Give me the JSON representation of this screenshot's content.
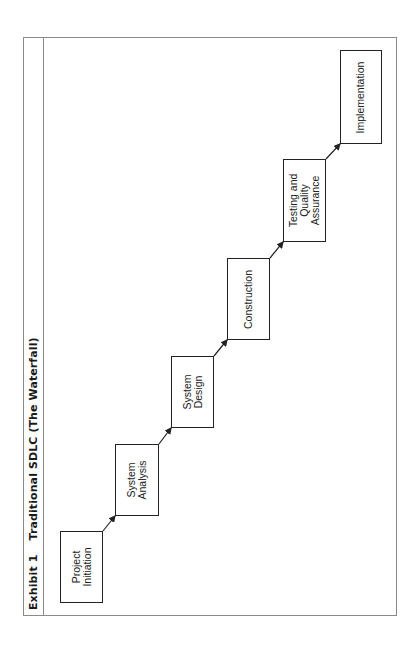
{
  "exhibit": {
    "number_label": "Exhibit 1",
    "title": "Traditional SDLC (The Waterfall)"
  },
  "stages": [
    {
      "id": "project-initiation",
      "label": "Project\nInitiation"
    },
    {
      "id": "system-analysis",
      "label": "System\nAnalysis"
    },
    {
      "id": "system-design",
      "label": "System\nDesign"
    },
    {
      "id": "construction",
      "label": "Construction"
    },
    {
      "id": "testing-qa",
      "label": "Testing and\nQuality\nAssurance"
    },
    {
      "id": "implementation",
      "label": "Implementation"
    }
  ],
  "connectors": [
    {
      "from": "project-initiation",
      "to": "system-analysis"
    },
    {
      "from": "system-analysis",
      "to": "system-design"
    },
    {
      "from": "system-design",
      "to": "construction"
    },
    {
      "from": "construction",
      "to": "testing-qa"
    },
    {
      "from": "testing-qa",
      "to": "implementation"
    }
  ],
  "colors": {
    "line": "#222222",
    "frame": "#8a8a8a",
    "background": "#ffffff"
  },
  "orientation": "rotated 90deg counterclockwise"
}
